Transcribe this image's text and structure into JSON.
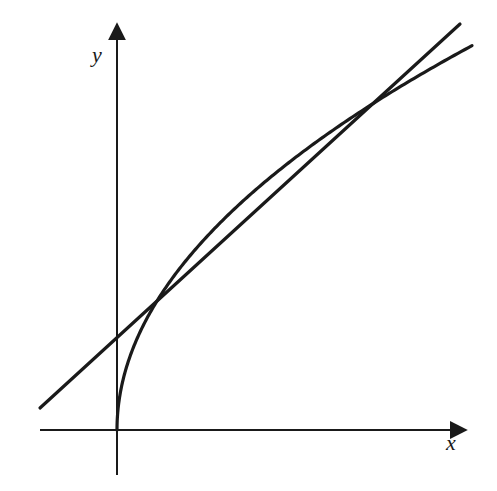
{
  "chart_data": {
    "type": "line",
    "title": "",
    "xlabel": "x",
    "ylabel": "y",
    "grid": false,
    "ticks": "none shown",
    "note": "No tick marks, numeric labels, or equations are visible. Curve and line shapes below are qualitative readings; the curve is drawn as a concave, square-root-like arc (visually fit), not a stated formula.",
    "series": [
      {
        "name": "curve",
        "shape": "concave increasing, starts at origin with vertical tangent",
        "color": "#1a1a1a"
      },
      {
        "name": "line",
        "shape": "straight line, positive slope, crosses y-axis above origin",
        "color": "#1a1a1a"
      }
    ],
    "features": {
      "intersections": 2,
      "description": "The line cuts the curve at two points; between them the curve lies above the line."
    }
  },
  "axes": {
    "x_label": "x",
    "y_label": "y"
  }
}
